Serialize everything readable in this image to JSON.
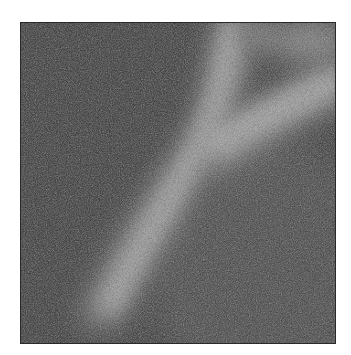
{
  "image": {
    "kind": "grayscale noisy micrograph",
    "description": "Bright diagonal band on dark noisy background, branching toward upper right",
    "colors": {
      "page_background": "#ffffff",
      "frame_border": "#2a2a2a",
      "background_dark": "#4a4a4a",
      "background_mid": "#5c5c5c",
      "band_bright": "#a8a8a8",
      "band_core": "#b4b4b4"
    }
  }
}
